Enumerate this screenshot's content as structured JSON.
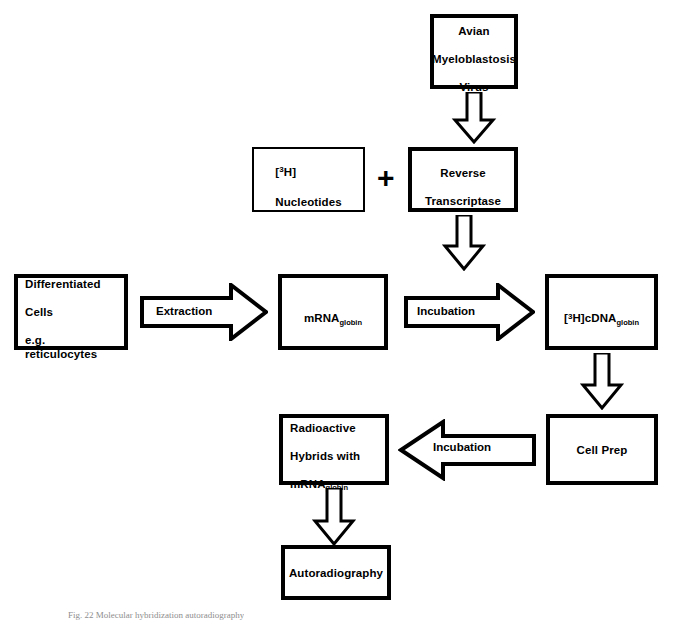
{
  "diagram": {
    "caption": "Fig. 22 Molecular hybridization autoradiography",
    "plus_symbol": "+",
    "colors": {
      "stroke": "#000000",
      "background": "#ffffff",
      "caption": "#8e8e8e"
    },
    "boxes": {
      "avian_virus": {
        "line1": "Avian",
        "line2": "Myeloblastosis",
        "line3": "Virus"
      },
      "nucleotides": {
        "prefix_bracket_open": "[",
        "superscript": "3",
        "isotope": "H]",
        "line2": "Nucleotides"
      },
      "reverse_transcriptase": {
        "line1": "Reverse",
        "line2": "Transcriptase"
      },
      "differentiated_cells": {
        "line1": "Differentiated",
        "line2": "Cells",
        "line3": "e.g. reticulocytes"
      },
      "mrna_globin": {
        "base": "mRNA",
        "subscript": "globin"
      },
      "cdna_globin": {
        "bracket_open": "[",
        "superscript": "3",
        "isotope": "H]cDNA",
        "subscript": "globin"
      },
      "cell_prep": {
        "label": "Cell Prep"
      },
      "radioactive_hybrids": {
        "line1": "Radioactive",
        "line2": "Hybrids with",
        "base": "mRNA",
        "subscript": "globin"
      },
      "autoradiography": {
        "label": "Autoradiography"
      }
    },
    "arrows": {
      "virus_to_transcriptase": {
        "label": "",
        "direction": "down"
      },
      "transcriptase_to_cdna": {
        "label": "",
        "direction": "down"
      },
      "extraction": {
        "label": "Extraction",
        "direction": "right"
      },
      "incubation_top": {
        "label": "Incubation",
        "direction": "right"
      },
      "cdna_to_cellprep": {
        "label": "",
        "direction": "down"
      },
      "incubation_bottom": {
        "label": "Incubation",
        "direction": "left"
      },
      "hybrids_to_autoradiography": {
        "label": "",
        "direction": "down"
      }
    }
  }
}
